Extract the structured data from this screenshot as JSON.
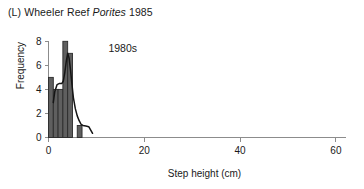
{
  "panel": {
    "label": "(L)",
    "title_prefix": "(L) Wheeler Reef ",
    "species": "Porites",
    "title_suffix": " 1985",
    "full_title": "(L) Wheeler Reef Porites 1985"
  },
  "annotation": {
    "decade": "1980s"
  },
  "axes": {
    "xlabel": "Step height (cm)",
    "ylabel": "Frequency",
    "x_ticks": [
      "0",
      "20",
      "40",
      "60"
    ],
    "y_ticks": [
      "0",
      "2",
      "4",
      "6",
      "8"
    ]
  },
  "colors": {
    "bar_fill": "#5f5f5f",
    "bar_stroke": "#2b2b2b",
    "curve": "#151515",
    "axis": "#8c8c8c",
    "text": "#1a1a1a",
    "background": "#ffffff"
  },
  "chart_data": {
    "type": "bar",
    "title": "(L) Wheeler Reef Porites 1985",
    "xlabel": "Step height (cm)",
    "ylabel": "Frequency",
    "xlim": [
      0,
      62
    ],
    "ylim": [
      0,
      8.4
    ],
    "xticks": [
      0,
      20,
      40,
      60
    ],
    "yticks": [
      0,
      2,
      4,
      6,
      8
    ],
    "grid": false,
    "legend": null,
    "annotations": [
      {
        "text": "1980s",
        "x": 12.5,
        "y": 7.1
      }
    ],
    "bin_width": 1,
    "categories": [
      1,
      2,
      3,
      4,
      5,
      6,
      7,
      8
    ],
    "values": [
      5,
      4,
      4,
      8,
      7,
      0,
      1,
      0
    ],
    "series": [
      {
        "name": "Step height frequency",
        "values": [
          5,
          4,
          4,
          8,
          7,
          0,
          1,
          0
        ]
      }
    ],
    "overlay_curve": {
      "type": "line",
      "name": "smoothed density",
      "x": [
        1.0,
        1.3,
        1.8,
        2.3,
        2.8,
        3.1,
        3.4,
        3.7,
        4.0,
        4.3,
        4.6,
        4.9,
        5.2,
        5.6,
        6.0,
        6.4,
        6.8,
        7.2,
        7.8,
        8.4,
        9.2
      ],
      "y": [
        2.9,
        3.8,
        4.4,
        4.5,
        4.5,
        4.7,
        5.4,
        6.3,
        7.0,
        6.6,
        5.6,
        4.4,
        3.3,
        2.4,
        1.8,
        1.4,
        1.1,
        1.0,
        0.95,
        0.9,
        0.35
      ]
    }
  }
}
